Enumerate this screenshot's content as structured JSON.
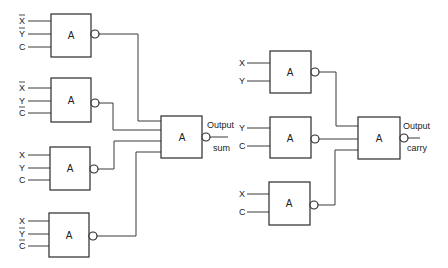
{
  "diagram": {
    "type": "logic-circuit",
    "gate_label": "A",
    "sum_circuit": {
      "input_gates": [
        {
          "id": "g1",
          "inputs": [
            {
              "name": "X",
              "inverted": true
            },
            {
              "name": "Y",
              "inverted": true
            },
            {
              "name": "C",
              "inverted": false
            }
          ]
        },
        {
          "id": "g2",
          "inputs": [
            {
              "name": "X",
              "inverted": true
            },
            {
              "name": "Y",
              "inverted": false
            },
            {
              "name": "C",
              "inverted": true
            }
          ]
        },
        {
          "id": "g3",
          "inputs": [
            {
              "name": "X",
              "inverted": false
            },
            {
              "name": "Y",
              "inverted": false
            },
            {
              "name": "C",
              "inverted": false
            }
          ]
        },
        {
          "id": "g4",
          "inputs": [
            {
              "name": "X",
              "inverted": false
            },
            {
              "name": "Y",
              "inverted": true
            },
            {
              "name": "C",
              "inverted": true
            }
          ]
        }
      ],
      "output_gate": {
        "label": "A",
        "output_label": "Output",
        "output_sublabel": "sum"
      }
    },
    "carry_circuit": {
      "input_gates": [
        {
          "id": "r1",
          "inputs": [
            {
              "name": "X",
              "inverted": false
            },
            {
              "name": "Y",
              "inverted": false
            }
          ]
        },
        {
          "id": "r2",
          "inputs": [
            {
              "name": "Y",
              "inverted": false
            },
            {
              "name": "C",
              "inverted": false
            }
          ]
        },
        {
          "id": "r3",
          "inputs": [
            {
              "name": "X",
              "inverted": false
            },
            {
              "name": "C",
              "inverted": false
            }
          ]
        }
      ],
      "output_gate": {
        "label": "A",
        "output_label": "Output",
        "output_sublabel": "carry"
      }
    }
  },
  "labels": {
    "g1_in": [
      "X",
      "Y",
      "C"
    ],
    "g2_in": [
      "X",
      "Y",
      "C"
    ],
    "g3_in": [
      "X",
      "Y",
      "C"
    ],
    "g4_in": [
      "X",
      "Y",
      "C"
    ],
    "r1_in": [
      "X",
      "Y"
    ],
    "r2_in": [
      "Y",
      "C"
    ],
    "r3_in": [
      "X",
      "C"
    ],
    "gate": "A",
    "output": "Output",
    "sum": "sum",
    "carry": "carry"
  }
}
